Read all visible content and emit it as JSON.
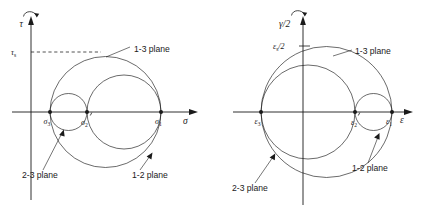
{
  "figure": {
    "panels": [
      {
        "id": "stress",
        "name": "mohr-circle-stress",
        "vertical_axis": {
          "label": "τ",
          "name": "tau-axis"
        },
        "horizontal_axis": {
          "label": "σ",
          "name": "sigma-axis"
        },
        "max_shear": {
          "label": "τ",
          "sub": "s",
          "value_y": 52,
          "dashed": true
        },
        "points": [
          {
            "key": "p3",
            "label": "σ",
            "sub": "3",
            "prime": false,
            "x": 50
          },
          {
            "key": "p2",
            "label": "σ",
            "sub": "2",
            "prime": true,
            "x": 87
          },
          {
            "key": "p1",
            "label": "σ",
            "sub": "1",
            "prime": false,
            "x": 161
          }
        ],
        "circles": [
          {
            "key": "c13",
            "label": "1-3 plane",
            "cx": 105.5,
            "cy": 112,
            "r": 55.5
          },
          {
            "key": "c12",
            "label": "1-2 plane",
            "cx": 124,
            "cy": 112,
            "r": 37
          },
          {
            "key": "c23",
            "label": "2-3 plane",
            "cx": 68.5,
            "cy": 112,
            "r": 18.5
          }
        ],
        "annotations": [
          {
            "key": "a13",
            "text": "1-3 plane",
            "x": 134,
            "y": 49
          },
          {
            "key": "a12",
            "text": "1-2 plane",
            "x": 132,
            "y": 175
          },
          {
            "key": "a23",
            "text": "2-3 plane",
            "x": 22,
            "y": 175
          }
        ]
      },
      {
        "id": "strain",
        "name": "mohr-circle-strain",
        "vertical_axis": {
          "label": "γ/2",
          "name": "gamma-half-axis"
        },
        "horizontal_axis": {
          "label": "ε",
          "name": "epsilon-axis"
        },
        "max_shear": {
          "label": "ε",
          "sub": "s",
          "suffix": "/2",
          "value_y": 46,
          "dashed": false
        },
        "points": [
          {
            "key": "p3",
            "label": "ε",
            "sub": "3",
            "prime": false,
            "x": 46
          },
          {
            "key": "p2",
            "label": "ε",
            "sub": "2",
            "prime": true,
            "x": 140
          },
          {
            "key": "p1",
            "label": "ε",
            "sub": "1",
            "prime": false,
            "x": 177
          }
        ],
        "circles": [
          {
            "key": "c13",
            "label": "1-3 plane",
            "cx": 111.5,
            "cy": 112,
            "r": 65.5
          },
          {
            "key": "c23",
            "label": "2-3 plane",
            "cx": 93,
            "cy": 112,
            "r": 47
          },
          {
            "key": "c12",
            "label": "1-2 plane",
            "cx": 158.5,
            "cy": 112,
            "r": 18.5
          }
        ],
        "annotations": [
          {
            "key": "a13",
            "text": "1-3 plane",
            "x": 140,
            "y": 51
          },
          {
            "key": "a12",
            "text": "1-2 plane",
            "x": 137,
            "y": 168
          },
          {
            "key": "a23",
            "text": "2-3 plane",
            "x": 17,
            "y": 188
          }
        ]
      }
    ],
    "colors": {
      "ink": "#1a1a1a",
      "background": "#ffffff"
    }
  }
}
